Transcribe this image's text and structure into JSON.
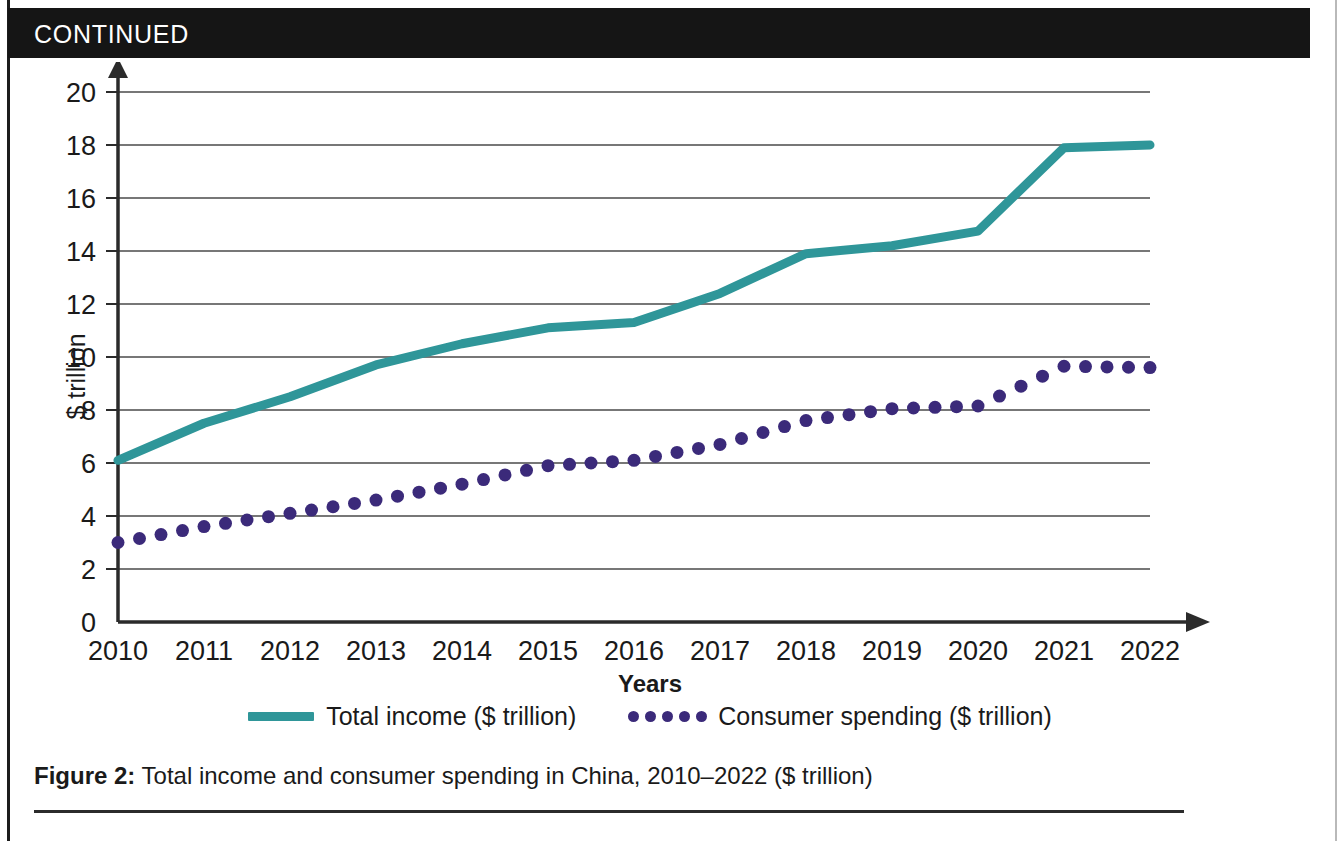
{
  "banner": {
    "label": "CONTINUED"
  },
  "caption": {
    "figure_label": "Figure 2:",
    "text": " Total income and consumer spending in China, 2010–2022 ($ trillion)"
  },
  "colors": {
    "teal": "#2f9699",
    "purple": "#3b2a7a",
    "grid": "#4a4a4a",
    "axis": "#2b2b2b",
    "banner_bg": "#151515",
    "banner_fg": "#ffffff"
  },
  "legend": {
    "position": "bottom-center",
    "entries": [
      {
        "label": "Total income ($ trillion)",
        "marker": "solid-line",
        "color": "#2f9699"
      },
      {
        "label": "Consumer spending ($ trillion)",
        "marker": "dotted",
        "color": "#3b2a7a"
      }
    ]
  },
  "chart_data": {
    "type": "line",
    "title": "",
    "xlabel": "Years",
    "ylabel": "$ trillion",
    "x": [
      2010,
      2011,
      2012,
      2013,
      2014,
      2015,
      2016,
      2017,
      2018,
      2019,
      2020,
      2021,
      2022
    ],
    "categories": [
      "2010",
      "2011",
      "2012",
      "2013",
      "2014",
      "2015",
      "2016",
      "2017",
      "2018",
      "2019",
      "2020",
      "2021",
      "2022"
    ],
    "xlim": [
      2010,
      2022
    ],
    "ylim": [
      0,
      20
    ],
    "yticks": [
      0,
      2,
      4,
      6,
      8,
      10,
      12,
      14,
      16,
      18,
      20
    ],
    "ytick_labels": [
      "0",
      "2",
      "4",
      "6",
      "8",
      "10",
      "12",
      "14",
      "16",
      "18",
      "20"
    ],
    "grid": true,
    "grid_axis": "y",
    "series": [
      {
        "name": "Total income ($ trillion)",
        "color": "#2f9699",
        "style": "solid",
        "values": [
          6.1,
          7.5,
          8.5,
          9.7,
          10.5,
          11.1,
          11.3,
          12.4,
          13.9,
          14.2,
          14.75,
          17.9,
          18.0
        ]
      },
      {
        "name": "Consumer spending ($ trillion)",
        "color": "#3b2a7a",
        "style": "dotted",
        "values": [
          3.0,
          3.6,
          4.1,
          4.6,
          5.2,
          5.9,
          6.1,
          6.7,
          7.6,
          8.05,
          8.15,
          9.65,
          9.6
        ]
      }
    ]
  }
}
